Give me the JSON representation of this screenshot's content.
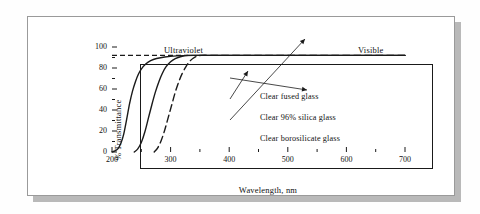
{
  "figure": {
    "band_labels": [
      {
        "name": "ultraviolet",
        "text": "Ultraviolet"
      },
      {
        "name": "visible",
        "text": "Visible"
      }
    ]
  },
  "chart_data": {
    "type": "line",
    "title": "",
    "xlabel": "Wavelength, nm",
    "ylabel": "% Transmittance",
    "xlim": [
      200,
      700
    ],
    "ylim": [
      0,
      100
    ],
    "xticks": [
      200,
      300,
      400,
      500,
      600,
      700
    ],
    "xticklabels": [
      "200",
      "300",
      "400",
      "500",
      "600",
      "700"
    ],
    "xminor_step": 50,
    "yticks": [
      0,
      20,
      40,
      60,
      80,
      100
    ],
    "yticklabels": [
      "0",
      "20",
      "40",
      "60",
      "80",
      "100"
    ],
    "yminor_step": 10,
    "grid": false,
    "legend": "annotations-with-leader-lines",
    "plateau_value": 92,
    "reference_line": {
      "name": "plateau-dashed-line",
      "y": 92,
      "x_start": 200,
      "x_end": 330,
      "style": "dashed"
    },
    "regions": [
      {
        "label": "Ultraviolet",
        "x_start": 200,
        "x_end": 400
      },
      {
        "label": "Visible",
        "x_start": 400,
        "x_end": 700
      }
    ],
    "series": [
      {
        "name": "Clear fused glass",
        "style": "solid",
        "points": [
          [
            200,
            0
          ],
          [
            205,
            1
          ],
          [
            210,
            3
          ],
          [
            215,
            8
          ],
          [
            220,
            17
          ],
          [
            225,
            31
          ],
          [
            230,
            46
          ],
          [
            235,
            58
          ],
          [
            240,
            67
          ],
          [
            245,
            74
          ],
          [
            250,
            79
          ],
          [
            258,
            84
          ],
          [
            266,
            87
          ],
          [
            276,
            89
          ],
          [
            290,
            90.5
          ],
          [
            310,
            91.5
          ],
          [
            340,
            92
          ],
          [
            400,
            92
          ],
          [
            500,
            92
          ],
          [
            600,
            92
          ],
          [
            700,
            92
          ]
        ]
      },
      {
        "name": "Clear 96% silica glass",
        "style": "solid",
        "points": [
          [
            238,
            0
          ],
          [
            244,
            3
          ],
          [
            250,
            9
          ],
          [
            256,
            19
          ],
          [
            262,
            32
          ],
          [
            268,
            45
          ],
          [
            274,
            57
          ],
          [
            280,
            67
          ],
          [
            286,
            75
          ],
          [
            292,
            81
          ],
          [
            300,
            86
          ],
          [
            308,
            89
          ],
          [
            318,
            91
          ],
          [
            330,
            92
          ],
          [
            360,
            92
          ],
          [
            400,
            92
          ],
          [
            500,
            92
          ],
          [
            600,
            92
          ],
          [
            700,
            92
          ]
        ]
      },
      {
        "name": "Clear borosilicate glass",
        "style": "dashed",
        "points": [
          [
            272,
            0
          ],
          [
            278,
            4
          ],
          [
            284,
            11
          ],
          [
            290,
            21
          ],
          [
            296,
            33
          ],
          [
            302,
            45
          ],
          [
            308,
            57
          ],
          [
            314,
            67
          ],
          [
            320,
            75
          ],
          [
            326,
            81
          ],
          [
            332,
            86
          ],
          [
            338,
            89
          ],
          [
            344,
            91
          ],
          [
            352,
            92
          ],
          [
            380,
            92
          ],
          [
            450,
            92
          ],
          [
            550,
            92
          ],
          [
            650,
            92
          ],
          [
            700,
            92
          ]
        ]
      }
    ],
    "annotations": [
      {
        "name": "annotation-fused",
        "text": "Clear fused glass",
        "target_x": 307,
        "target_y": 90
      },
      {
        "name": "annotation-silica",
        "text": "Clear 96% silica glass",
        "target_x": 248,
        "target_y": 71
      },
      {
        "name": "annotation-borosilicate",
        "text": "Clear borosilicate glass",
        "target_x": 305,
        "target_y": 39
      }
    ]
  }
}
